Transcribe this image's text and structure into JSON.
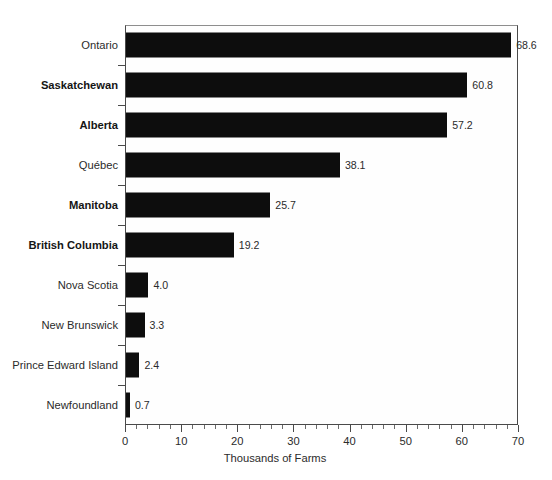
{
  "chart_data": {
    "type": "bar",
    "orientation": "horizontal",
    "title": "",
    "xlabel": "Thousands of Farms",
    "ylabel": "",
    "xlim": [
      0,
      70
    ],
    "ylim": null,
    "grid": false,
    "legend": null,
    "bar_color": "#0d0d0d",
    "x_major_ticks": [
      0,
      10,
      20,
      30,
      40,
      50,
      60,
      70
    ],
    "x_minor_tick_step": 2,
    "x_tick_labels": [
      "0",
      "10",
      "20",
      "30",
      "40",
      "50",
      "60",
      "70"
    ],
    "categories": [
      "Ontario",
      "Saskatchewan",
      "Alberta",
      "Québec",
      "Manitoba",
      "British Columbia",
      "Nova Scotia",
      "New Brunswick",
      "Prince Edward Island",
      "Newfoundland"
    ],
    "values": [
      68.6,
      60.8,
      57.2,
      38.1,
      25.7,
      19.2,
      4.0,
      3.3,
      2.4,
      0.7
    ],
    "value_labels": [
      "68.6",
      "60.8",
      "57.2",
      "38.1",
      "25.7",
      "19.2",
      "4.0",
      "3.3",
      "2.4",
      "0.7"
    ],
    "emphasized_categories": [
      "Saskatchewan",
      "Alberta",
      "Manitoba",
      "British Columbia"
    ],
    "bars": [
      {
        "label": "Ontario",
        "value": 68.6,
        "value_label": "68.6",
        "bold": false
      },
      {
        "label": "Saskatchewan",
        "value": 60.8,
        "value_label": "60.8",
        "bold": true
      },
      {
        "label": "Alberta",
        "value": 57.2,
        "value_label": "57.2",
        "bold": true
      },
      {
        "label": "Québec",
        "value": 38.1,
        "value_label": "38.1",
        "bold": false
      },
      {
        "label": "Manitoba",
        "value": 25.7,
        "value_label": "25.7",
        "bold": true
      },
      {
        "label": "British Columbia",
        "value": 19.2,
        "value_label": "19.2",
        "bold": true
      },
      {
        "label": "Nova Scotia",
        "value": 4.0,
        "value_label": "4.0",
        "bold": false
      },
      {
        "label": "New Brunswick",
        "value": 3.3,
        "value_label": "3.3",
        "bold": false
      },
      {
        "label": "Prince Edward Island",
        "value": 2.4,
        "value_label": "2.4",
        "bold": false
      },
      {
        "label": "Newfoundland",
        "value": 0.7,
        "value_label": "0.7",
        "bold": false
      }
    ]
  }
}
